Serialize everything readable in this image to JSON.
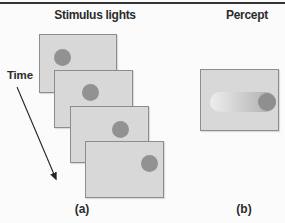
{
  "figure": {
    "stimulus_title": "Stimulus lights",
    "percept_title": "Percept",
    "time_label": "Time",
    "caption_a": "(a)",
    "caption_b": "(b)"
  },
  "colors": {
    "background": "#fbfbfb",
    "top_rule": "#333333",
    "text": "#2b2b2b",
    "frame_fill": "#d8d8d8",
    "frame_border": "#8d8d8d",
    "dot": "#929292",
    "streak_start": "#eeeeee",
    "streak_end": "#ababab",
    "percept_dot": "#8f8f8f",
    "arrow": "#222222"
  },
  "stimulus": {
    "dot_radius": 8.5,
    "frames": [
      {
        "x": 39,
        "y": 34,
        "w": 78,
        "h": 59,
        "dot_cx": 22,
        "dot_cy": 22
      },
      {
        "x": 54,
        "y": 70,
        "w": 79,
        "h": 58,
        "dot_cx": 35,
        "dot_cy": 21
      },
      {
        "x": 70,
        "y": 106,
        "w": 79,
        "h": 57,
        "dot_cx": 49,
        "dot_cy": 22
      },
      {
        "x": 85,
        "y": 141,
        "w": 79,
        "h": 57,
        "dot_cx": 63,
        "dot_cy": 21
      }
    ]
  },
  "percept": {
    "panel": {
      "x": 200,
      "y": 69,
      "w": 79,
      "h": 62
    },
    "streak": {
      "x": 9,
      "y": 22,
      "w": 66,
      "h": 20
    },
    "dot": {
      "cx": 66,
      "cy": 32,
      "r": 9
    }
  },
  "time_arrow": {
    "x1": 17,
    "y1": 87,
    "x2": 56,
    "y2": 179
  }
}
